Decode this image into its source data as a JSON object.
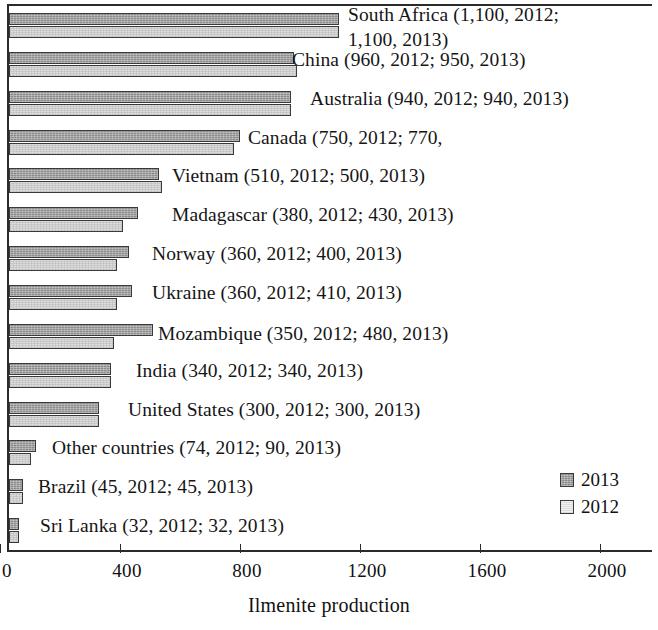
{
  "chart_data": {
    "type": "bar",
    "orientation": "horizontal",
    "title": "",
    "xlabel": "Ilmenite production",
    "ylabel": "",
    "xlim": [
      0,
      2200
    ],
    "xticks": [
      0,
      400,
      800,
      1200,
      1600,
      2000
    ],
    "xtick_labels": [
      "0",
      "400",
      "800",
      "1200",
      "1600",
      "2000"
    ],
    "grid": false,
    "legend_position": "lower-right",
    "categories": [
      "South Africa",
      "China",
      "Australia",
      "Canada",
      "Vietnam",
      "Madagascar",
      "Norway",
      "Ukraine",
      "Mozambique",
      "India",
      "United States",
      "Other countries",
      "Brazil",
      "Sri Lanka"
    ],
    "series": [
      {
        "name": "2013",
        "color": "#8c8c8c",
        "values": [
          1100,
          950,
          940,
          770,
          500,
          430,
          400,
          410,
          480,
          340,
          300,
          90,
          45,
          32
        ]
      },
      {
        "name": "2012",
        "color": "#dcdcdc",
        "values": [
          1100,
          960,
          940,
          750,
          510,
          380,
          360,
          360,
          350,
          340,
          300,
          74,
          45,
          32
        ]
      }
    ],
    "point_labels": [
      "South Africa (1,100, 2012;\n1,100, 2013)",
      "China (960, 2012; 950, 2013)",
      "Australia (940, 2012; 940, 2013)",
      "Canada (750, 2012; 770,",
      "Vietnam (510, 2012; 500, 2013)",
      "Madagascar (380, 2012; 430, 2013)",
      "Norway (360, 2012; 400, 2013)",
      "Ukraine (360, 2012; 410, 2013)",
      "Mozambique (350, 2012; 480, 2013)",
      "India (340, 2012; 340, 2013)",
      "United States (300, 2012; 300, 2013)",
      "Other countries (74, 2012; 90, 2013)",
      "Brazil (45, 2012; 45, 2013)",
      "Sri Lanka (32, 2012; 32, 2013)"
    ],
    "legend": [
      {
        "label": "2013",
        "color": "#8c8c8c"
      },
      {
        "label": "2012",
        "color": "#dcdcdc"
      }
    ]
  },
  "axis": {
    "x_title": "Ilmenite production",
    "tick_labels": [
      "0",
      "400",
      "800",
      "1200",
      "1600",
      "2000"
    ]
  },
  "legend": {
    "items": [
      {
        "label": "2013"
      },
      {
        "label": "2012"
      }
    ]
  },
  "labels": {
    "l0": "South Africa (1,100, 2012;",
    "l0b": "1,100, 2013)",
    "l1": "China (960, 2012; 950, 2013)",
    "l2": "Australia (940, 2012; 940, 2013)",
    "l3": "Canada (750, 2012; 770,",
    "l4": "Vietnam (510, 2012; 500, 2013)",
    "l5": "Madagascar (380, 2012; 430, 2013)",
    "l6": "Norway (360, 2012; 400, 2013)",
    "l7": "Ukraine (360, 2012; 410, 2013)",
    "l8": "Mozambique (350, 2012; 480, 2013)",
    "l9": "India (340, 2012; 340, 2013)",
    "l10": "United States (300, 2012; 300, 2013)",
    "l11": "Other countries (74, 2012; 90, 2013)",
    "l12": "Brazil (45, 2012; 45, 2013)",
    "l13": "Sri Lanka (32, 2012; 32, 2013)"
  }
}
